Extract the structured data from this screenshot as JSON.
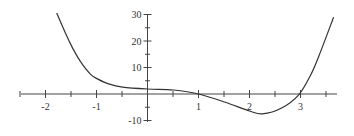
{
  "chart_data": {
    "type": "line",
    "title": "",
    "xlabel": "",
    "ylabel": "",
    "xlim": [
      -2.5,
      3.7
    ],
    "ylim": [
      -10,
      30
    ],
    "grid": false,
    "legend": null,
    "x_ticks": [
      -2,
      -1,
      1,
      2,
      3
    ],
    "x_tick_labels": [
      "-2",
      "-1",
      "1",
      "2",
      "3"
    ],
    "x_minor_step": 0.5,
    "y_ticks": [
      30,
      20,
      10,
      -10
    ],
    "y_tick_labels": [
      "30",
      "20",
      "10",
      "-10"
    ],
    "y_minor_step": 5,
    "series": [
      {
        "name": "f(x)",
        "color": "#333333",
        "x": [
          -1.78,
          -1.61,
          -1.47,
          -1.31,
          -1.12,
          -0.98,
          -0.76,
          -0.49,
          0,
          0.51,
          1,
          1.51,
          2,
          2.25,
          2.63,
          2.96,
          3.2,
          3.39,
          3.65
        ],
        "y": [
          30.6,
          23.0,
          17.4,
          12.1,
          7.5,
          5.7,
          3.8,
          2.6,
          1.9,
          1.5,
          0,
          -3.0,
          -6.4,
          -7.5,
          -5.3,
          -0.4,
          7.2,
          15.8,
          29.0
        ]
      }
    ],
    "annotations": {
      "x_intercepts": [
        1,
        2.95
      ],
      "minimum": {
        "x": 2.25,
        "y": -7.5
      }
    }
  },
  "layout": {
    "origin_px": [
      147.5,
      94
    ],
    "px_per_x": 51,
    "px_per_y": 2.65,
    "x_axis_px": [
      21,
      337
    ],
    "y_axis_px": [
      15,
      122
    ]
  }
}
